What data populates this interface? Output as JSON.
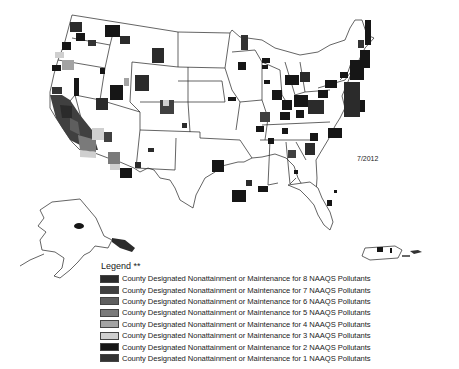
{
  "map": {
    "date": "7/2012",
    "regions": [
      "Contiguous United States",
      "Alaska",
      "Puerto Rico"
    ]
  },
  "legend": {
    "title": "Legend **",
    "items": [
      {
        "label": "County Designated Nonattainment or Maintenance for 8 NAAQS Pollutants",
        "color": "#2b2b2b"
      },
      {
        "label": "County Designated Nonattainment or Maintenance for 7 NAAQS Pollutants",
        "color": "#404040"
      },
      {
        "label": "County Designated Nonattainment or Maintenance for 6 NAAQS Pollutants",
        "color": "#5e5e5e"
      },
      {
        "label": "County Designated Nonattainment or Maintenance for 5 NAAQS Pollutants",
        "color": "#7a7a7a"
      },
      {
        "label": "County Designated Nonattainment or Maintenance for 4 NAAQS Pollutants",
        "color": "#a3a3a3"
      },
      {
        "label": "County Designated Nonattainment or Maintenance for 3 NAAQS Pollutants",
        "color": "#cfcfcf"
      },
      {
        "label": "County Designated Nonattainment or Maintenance for 2 NAAQS Pollutants",
        "color": "#161616"
      },
      {
        "label": "County Designated Nonattainment or Maintenance for 1 NAAQS Pollutants",
        "color": "#333333"
      }
    ]
  }
}
